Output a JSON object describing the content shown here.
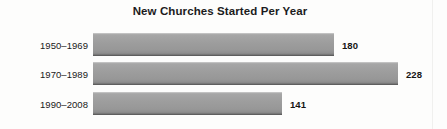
{
  "chart_data": {
    "type": "bar",
    "orientation": "horizontal",
    "title": "New Churches Started Per Year",
    "xlabel": "",
    "ylabel": "",
    "categories": [
      "1950–1969",
      "1970–1989",
      "1990–2008"
    ],
    "values": [
      180,
      228,
      141
    ],
    "value_labels": [
      "180",
      "228",
      "141"
    ],
    "xlim": [
      0,
      228
    ],
    "grid": false,
    "legend": false,
    "series": [
      {
        "name": "New churches started per year",
        "values": [
          180,
          228,
          141
        ]
      }
    ],
    "colors": {
      "bar_fill": "#9d9d9d",
      "bar_top_highlight": "#c2c2c2",
      "bar_bottom_edge": "#5e5e5e",
      "text": "#1a1a1a",
      "background": "#fdfdfc"
    }
  }
}
